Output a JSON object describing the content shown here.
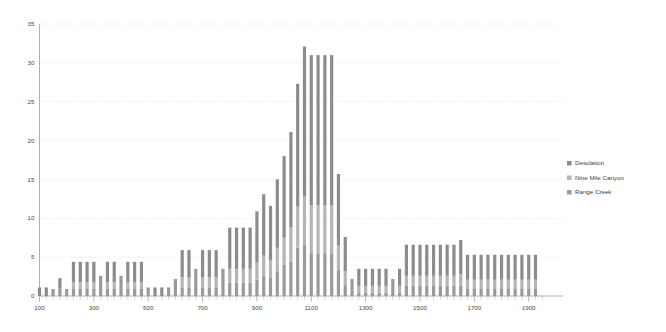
{
  "chart_data": {
    "type": "bar",
    "stacked": true,
    "title": "",
    "subtitle": "",
    "xlabel": "",
    "ylabel": "",
    "xlim": [
      100,
      1960
    ],
    "ylim": [
      0,
      35
    ],
    "ytick_step": 5,
    "yticks": [
      0,
      5,
      10,
      15,
      20,
      25,
      30,
      35
    ],
    "xticks": [
      100,
      300,
      500,
      700,
      900,
      1100,
      1300,
      1500,
      1700,
      1900
    ],
    "xtick_minor_step": 25,
    "bin_width": 25,
    "grid": true,
    "legend_position": "right",
    "colors": {
      "Desolation": "#8c8c8c",
      "Nine Mile Canyon": "#b5b5b5",
      "Range Creek": "#9a9a9a"
    },
    "x": [
      100,
      125,
      150,
      175,
      200,
      225,
      250,
      275,
      300,
      325,
      350,
      375,
      400,
      425,
      450,
      475,
      500,
      525,
      550,
      575,
      600,
      625,
      650,
      675,
      700,
      725,
      750,
      775,
      800,
      825,
      850,
      875,
      900,
      925,
      950,
      975,
      1000,
      1025,
      1050,
      1075,
      1100,
      1125,
      1150,
      1175,
      1200,
      1225,
      1250,
      1275,
      1300,
      1325,
      1350,
      1375,
      1400,
      1425,
      1450,
      1475,
      1500,
      1525,
      1550,
      1575,
      1600,
      1625,
      1650,
      1675,
      1700,
      1725,
      1750,
      1775,
      1800,
      1825,
      1850,
      1875,
      1900,
      1925
    ],
    "series": [
      {
        "name": "Desolation",
        "values": [
          1.1,
          1.1,
          0.0,
          1.3,
          0.0,
          2.6,
          2.6,
          2.6,
          2.6,
          0.0,
          2.6,
          2.6,
          0.0,
          2.6,
          2.6,
          2.6,
          0.0,
          1.1,
          1.1,
          0.0,
          0.0,
          3.5,
          3.5,
          0.0,
          3.5,
          3.5,
          3.5,
          0.0,
          5.3,
          5.3,
          5.3,
          5.3,
          6.6,
          7.9,
          7.0,
          8.8,
          10.5,
          12.3,
          15.8,
          19.3,
          19.3,
          19.3,
          19.3,
          19.3,
          9.2,
          4.4,
          0.0,
          2.2,
          2.2,
          2.2,
          2.2,
          2.2,
          0.0,
          2.2,
          4.0,
          4.0,
          4.0,
          4.0,
          4.0,
          4.0,
          4.0,
          4.0,
          4.4,
          3.2,
          3.2,
          3.2,
          3.2,
          3.2,
          3.2,
          3.2,
          3.2,
          3.2,
          3.2,
          3.2
        ]
      },
      {
        "name": "Nine Mile Canyon",
        "values": [
          0.0,
          0.0,
          0.0,
          0.0,
          0.0,
          0.9,
          0.9,
          0.9,
          0.9,
          0.0,
          0.9,
          0.9,
          0.0,
          0.9,
          0.9,
          0.9,
          0.0,
          0.0,
          0.0,
          0.0,
          0.0,
          1.3,
          1.3,
          0.0,
          1.3,
          1.3,
          1.3,
          0.0,
          1.8,
          1.8,
          1.8,
          1.8,
          2.2,
          2.6,
          2.2,
          3.1,
          3.5,
          4.4,
          5.3,
          6.2,
          6.2,
          6.2,
          6.2,
          6.2,
          3.1,
          1.8,
          0.0,
          0.9,
          0.9,
          0.9,
          0.9,
          0.9,
          0.0,
          0.9,
          1.3,
          1.3,
          1.3,
          1.3,
          1.3,
          1.3,
          1.3,
          1.3,
          1.5,
          1.1,
          1.1,
          1.1,
          1.1,
          1.1,
          1.1,
          1.1,
          1.1,
          1.1,
          1.1,
          1.1
        ]
      },
      {
        "name": "Range Creek",
        "values": [
          0.0,
          0.0,
          0.9,
          1.0,
          0.9,
          0.9,
          0.9,
          0.9,
          0.9,
          2.6,
          0.9,
          0.9,
          2.6,
          0.9,
          0.9,
          0.9,
          1.1,
          0.0,
          0.0,
          1.1,
          2.2,
          1.1,
          1.1,
          3.5,
          1.1,
          1.1,
          1.1,
          3.5,
          1.7,
          1.7,
          1.7,
          1.7,
          2.1,
          2.6,
          2.4,
          3.1,
          4.0,
          4.4,
          6.2,
          6.6,
          5.5,
          5.5,
          5.5,
          5.5,
          3.4,
          1.4,
          2.2,
          0.4,
          0.4,
          0.4,
          0.4,
          0.4,
          2.2,
          0.4,
          1.3,
          1.3,
          1.3,
          1.3,
          1.3,
          1.3,
          1.3,
          1.3,
          1.3,
          1.0,
          1.0,
          1.0,
          1.0,
          1.0,
          1.0,
          1.0,
          1.0,
          1.0,
          1.0,
          1.0
        ]
      }
    ],
    "totals": [
      1.1,
      1.1,
      0.9,
      2.3,
      0.9,
      4.4,
      4.4,
      4.4,
      4.4,
      2.6,
      4.4,
      4.4,
      2.6,
      4.4,
      4.4,
      4.4,
      1.1,
      1.1,
      1.1,
      1.1,
      2.2,
      5.9,
      5.9,
      3.5,
      5.9,
      5.9,
      5.9,
      3.5,
      8.8,
      8.8,
      8.8,
      8.8,
      10.9,
      13.1,
      11.6,
      15.0,
      18.0,
      21.1,
      27.3,
      32.1,
      31.0,
      31.0,
      31.0,
      31.0,
      15.7,
      7.6,
      2.2,
      3.5,
      3.5,
      3.5,
      3.5,
      3.5,
      2.2,
      3.5,
      6.6,
      6.6,
      6.6,
      6.6,
      6.6,
      6.6,
      6.6,
      6.6,
      7.2,
      5.3,
      5.3,
      5.3,
      5.3,
      5.3,
      5.3,
      5.3,
      5.3,
      5.3,
      5.3,
      5.3
    ]
  },
  "legend": {
    "items": [
      {
        "label": "Desolation",
        "color": "#8c8c8c"
      },
      {
        "label": "Nine Mile Canyon",
        "color": "#b5b5b5"
      },
      {
        "label": "Range Creek",
        "color": "#9a9a9a"
      }
    ]
  },
  "axes": {
    "y_tick_labels": [
      "0",
      "5",
      "10",
      "15",
      "20",
      "25",
      "30",
      "35"
    ],
    "x_tick_labels": [
      "100",
      "300",
      "500",
      "700",
      "900",
      "1100",
      "1300",
      "1500",
      "1700",
      "1900"
    ]
  }
}
